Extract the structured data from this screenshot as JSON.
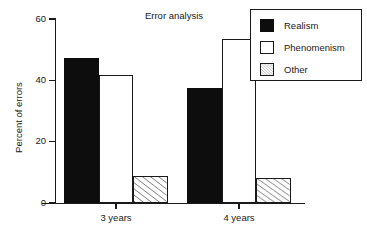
{
  "chart_data": {
    "type": "bar",
    "title": "Error analysis",
    "xlabel": "",
    "ylabel": "Percent of errors",
    "categories": [
      "3 years",
      "4 years"
    ],
    "series": [
      {
        "name": "Realism",
        "style": "solid",
        "values": [
          47.3,
          37.5
        ]
      },
      {
        "name": "Phenomenism",
        "style": "open",
        "values": [
          41.7,
          53.5
        ]
      },
      {
        "name": "Other",
        "style": "hatch",
        "values": [
          8.8,
          8.2
        ]
      }
    ],
    "ylim": [
      0,
      60
    ],
    "yticks": [
      0,
      20,
      40,
      60
    ],
    "ytick_labels": [
      "0",
      "20",
      "40",
      "60"
    ],
    "grid": false,
    "legend_position": "top-right",
    "colors": {
      "realism": "#0d0d0d",
      "phenomenism": "#ffffff",
      "other": "#ffffff",
      "outline": "#1a1a1a",
      "background": "#ffffff"
    }
  },
  "legend": {
    "entries": [
      {
        "label": "Realism"
      },
      {
        "label": "Phenomenism"
      },
      {
        "label": "Other"
      }
    ]
  }
}
